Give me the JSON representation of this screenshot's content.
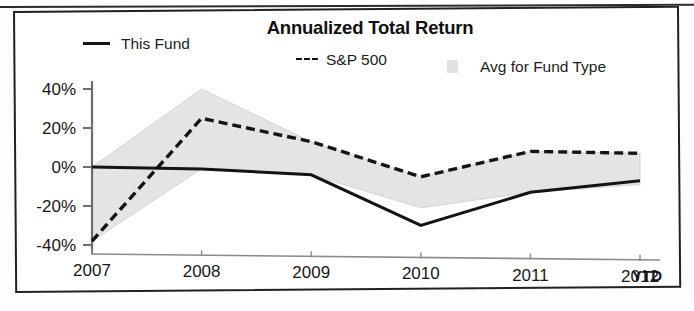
{
  "chart_data": {
    "type": "line",
    "title": "Annualized Total Return",
    "xlabel": "",
    "ylabel": "",
    "ylim": [
      -50,
      45
    ],
    "grid": false,
    "legend_position": "top",
    "categories": [
      "2007",
      "2008",
      "2009",
      "2010",
      "2011",
      "2012"
    ],
    "x_tick_labels": [
      "2007",
      "2008",
      "2009",
      "2010",
      "2011",
      "2012"
    ],
    "x_axis_suffix": "YTD",
    "y_tick_labels": [
      "40%",
      "20%",
      "0%",
      "-20%",
      "-40%"
    ],
    "y_tick_values": [
      40,
      20,
      0,
      -20,
      -40
    ],
    "series": [
      {
        "name": "This Fund",
        "style": "solid",
        "color": "#141414",
        "values": [
          0,
          -1,
          -4,
          -30,
          -13,
          -7
        ]
      },
      {
        "name": "S&P 500",
        "style": "dashed",
        "color": "#141414",
        "values": [
          -38,
          25,
          13,
          -5,
          8,
          7
        ]
      },
      {
        "name": "Avg for Fund Type",
        "style": "band",
        "color": "#e4e4e4",
        "band_upper": [
          0,
          40,
          13,
          -5,
          8,
          7
        ],
        "band_lower": [
          -38,
          -1,
          -4,
          -21,
          -13,
          -9
        ]
      }
    ],
    "legend": [
      {
        "label": "This Fund",
        "marker": "solid-line"
      },
      {
        "label": "S&P 500",
        "marker": "dashed-line"
      },
      {
        "label": "Avg for Fund Type",
        "marker": "gray-band-swatch"
      }
    ],
    "colors": {
      "line": "#141414",
      "band_fill": "#e4e4e4",
      "axis": "#6e6e6e",
      "frame": "#212121"
    }
  }
}
